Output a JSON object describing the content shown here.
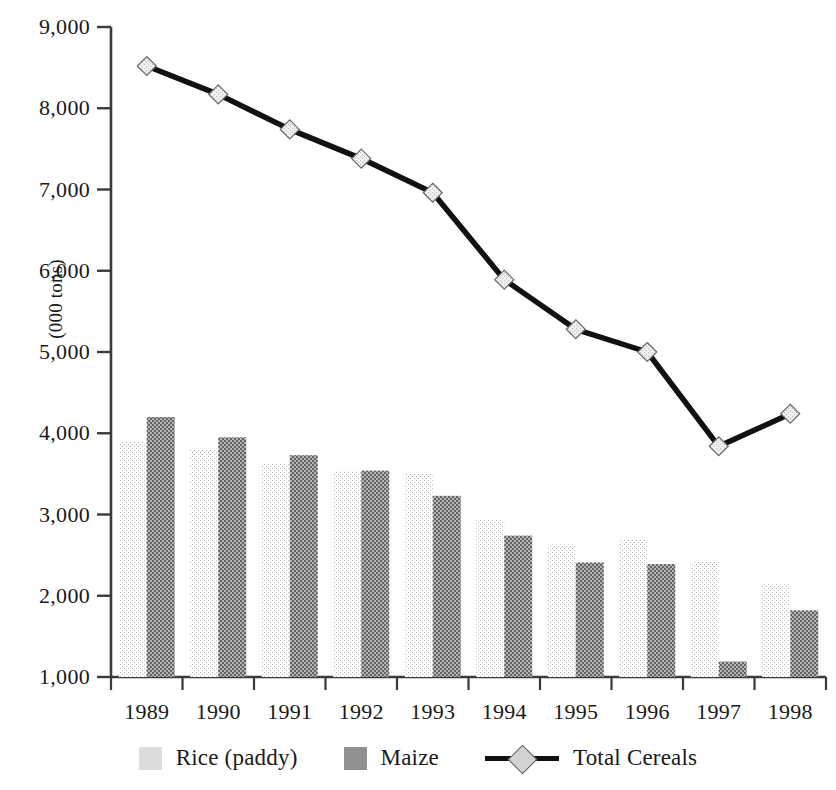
{
  "chart_data": {
    "type": "bar",
    "title": "",
    "subtitle": "",
    "xlabel": "",
    "ylabel": "(000 tons)",
    "categories": [
      "1989",
      "1990",
      "1991",
      "1992",
      "1993",
      "1994",
      "1995",
      "1996",
      "1997",
      "1998"
    ],
    "ylim": [
      1000,
      9000
    ],
    "ytick_values": [
      1000,
      2000,
      3000,
      4000,
      5000,
      6000,
      7000,
      8000,
      9000
    ],
    "ytick_labels": [
      "1,000",
      "2,000",
      "3,000",
      "4,000",
      "5,000",
      "6,000",
      "7,000",
      "8,000",
      "9,000"
    ],
    "grid": false,
    "legend_position": "bottom",
    "series": [
      {
        "name": "Rice (paddy)",
        "type": "bar",
        "color": "#dcdcdc",
        "values": [
          3890,
          3810,
          3630,
          3540,
          3500,
          2940,
          2630,
          2690,
          2420,
          2140
        ]
      },
      {
        "name": "Maize",
        "type": "bar",
        "color": "#8f8f8f",
        "values": [
          4200,
          3950,
          3730,
          3540,
          3230,
          2740,
          2410,
          2390,
          1190,
          1820
        ]
      },
      {
        "name": "Total Cereals",
        "type": "line",
        "color": "#111111",
        "marker": "diamond",
        "marker_color": "#d2d2d2",
        "values": [
          8520,
          8170,
          7740,
          7380,
          6960,
          5890,
          5280,
          5000,
          3840,
          4240
        ]
      }
    ]
  },
  "legend": {
    "items": [
      {
        "label": "Rice (paddy)",
        "marker": "square-swatch-light"
      },
      {
        "label": "Maize",
        "marker": "square-swatch-dark"
      },
      {
        "label": "Total Cereals",
        "marker": "line-with-diamond"
      }
    ]
  },
  "axes": {
    "y_axis_title": "(000 tons)"
  }
}
